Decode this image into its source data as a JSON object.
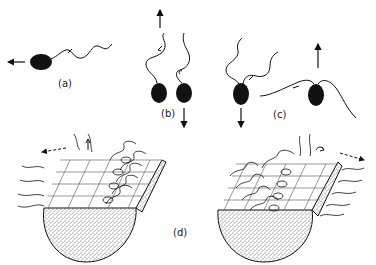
{
  "figure": {
    "panels": [
      {
        "id": "a",
        "label": "(a)",
        "description": "Single flagellate swimming left, flagellum trailing behind",
        "arrows": [
          "left"
        ]
      },
      {
        "id": "b",
        "label": "(b)",
        "description": "Two cells with single anterior flagellum: one moving up, one moving down",
        "arrows": [
          "up",
          "down"
        ]
      },
      {
        "id": "c",
        "label": "(c)",
        "description": "Biflagellate cells: one moving down with flagella forward, one moving up with breaststroke flagella",
        "arrows": [
          "down",
          "up"
        ]
      },
      {
        "id": "d",
        "label": "(d)",
        "description": "Ciliated surface on hemispherical body showing metachronal waves, two orientations",
        "arrows": [
          "left",
          "up",
          "right",
          "curl"
        ]
      }
    ],
    "colors": {
      "ink": "#111111",
      "stipple": "#9a9a9a",
      "background": "#ffffff"
    }
  }
}
